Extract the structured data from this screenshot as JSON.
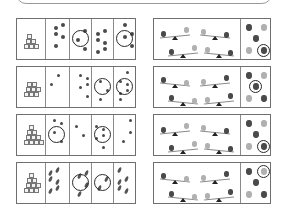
{
  "page": {
    "type": "counting worksheet",
    "has_text": false
  },
  "colors": {
    "border": "#6f6f6f",
    "divider": "#8a8a8a",
    "ring": "#2a2a2a",
    "fruit_dark": "#4a4a4a",
    "fruit_light": "#b0b0b0"
  },
  "left_column": {
    "rows": [
      {
        "id": "row-1",
        "cube_count": 6,
        "answer_cells": 4,
        "item": "dot",
        "circled_cells": [
          2,
          4
        ]
      },
      {
        "id": "row-2",
        "cube_count": 8,
        "answer_cells": 4,
        "item": "acorn",
        "circled_cells": [
          3,
          4
        ]
      },
      {
        "id": "row-3",
        "cube_count": 10,
        "answer_cells": 4,
        "item": "seed",
        "circled_cells": [
          1,
          3
        ]
      },
      {
        "id": "row-4",
        "cube_count": 9,
        "answer_cells": 4,
        "item": "banana",
        "circled_cells": [
          2,
          3
        ]
      }
    ]
  },
  "right_column": {
    "rows": [
      {
        "id": "row-1",
        "seesaws": 4,
        "answer_options": 5,
        "circled_option": 5
      },
      {
        "id": "row-2",
        "seesaws": 4,
        "answer_options": 5,
        "circled_option": 3
      },
      {
        "id": "row-3",
        "seesaws": 4,
        "answer_options": 5,
        "circled_option": 5
      },
      {
        "id": "row-4",
        "seesaws": 4,
        "answer_options": 5,
        "circled_option": 2
      }
    ]
  }
}
